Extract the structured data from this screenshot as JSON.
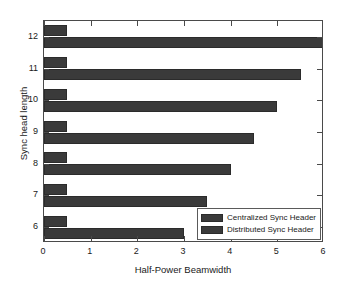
{
  "chart_data": {
    "type": "bar",
    "orientation": "horizontal",
    "title": "",
    "xlabel": "Half-Power Beamwidth",
    "ylabel": "Sync head length",
    "categories": [
      "12",
      "11",
      "10",
      "9",
      "8",
      "7",
      "6"
    ],
    "series": [
      {
        "name": "Centralized Sync Header",
        "values": [
          0.5,
          0.5,
          0.5,
          0.5,
          0.5,
          0.5,
          0.5
        ],
        "color": "#3a3a3a"
      },
      {
        "name": "Distributed Sync Header",
        "values": [
          6.0,
          5.5,
          5.0,
          4.5,
          4.0,
          3.5,
          3.0
        ],
        "color": "#3a3a3a"
      }
    ],
    "xlim": [
      0,
      6
    ],
    "xticks": [
      "0",
      "1",
      "2",
      "3",
      "4",
      "5",
      "6"
    ],
    "yticks": [
      "12",
      "11",
      "10",
      "9",
      "8",
      "7",
      "6"
    ],
    "grid": false,
    "legend_position": "lower-right"
  },
  "legend": {
    "entries": [
      {
        "label": "Centralized Sync Header"
      },
      {
        "label": "Distributed Sync Header"
      }
    ]
  }
}
